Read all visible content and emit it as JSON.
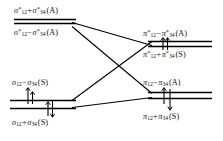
{
  "diagram": {
    "type": "molecular-orbital-correlation-diagram",
    "background_color": "#ffffff",
    "line_color": "#000000",
    "text_color": "#111111",
    "levels": {
      "sigma_star_antisym_plus": {
        "id": "sigma-star-plus",
        "label_text": "σ*12 + σ*34 (A)",
        "symbol": "σ",
        "star": "*",
        "sub_left": "12",
        "operator": "+",
        "sub_right": "34",
        "symmetry": "(A)",
        "side": "left",
        "position": "top"
      },
      "sigma_star_antisym_minus": {
        "id": "sigma-star-minus",
        "label_text": "σ*12 − σ*34 (A)",
        "symbol": "σ",
        "star": "*",
        "sub_left": "12",
        "operator": "−",
        "sub_right": "34",
        "symmetry": "(A)",
        "side": "left",
        "position": "upper-middle"
      },
      "pi_star_antisym_minus": {
        "id": "pi-star-minus",
        "label_text": "π*12 − π*34 (A)",
        "symbol": "π",
        "star": "*",
        "sub_left": "12",
        "operator": "−",
        "sub_right": "34",
        "symmetry": "(A)",
        "side": "right",
        "position": "top"
      },
      "pi_star_sym_plus": {
        "id": "pi-star-plus",
        "label_text": "π*12 + π*34 (S)",
        "symbol": "π",
        "star": "*",
        "sub_left": "12",
        "operator": "+",
        "sub_right": "34",
        "symmetry": "(S)",
        "side": "right",
        "position": "upper-middle"
      },
      "sigma_sym_minus": {
        "id": "sigma-minus",
        "label_text": "σ12 − σ34 (S)",
        "symbol": "σ",
        "star": "",
        "sub_left": "12",
        "operator": "−",
        "sub_right": "34",
        "symmetry": "(S)",
        "side": "left",
        "position": "lower-middle"
      },
      "sigma_sym_plus": {
        "id": "sigma-plus",
        "label_text": "σ12 + σ34 (S)",
        "symbol": "σ",
        "star": "",
        "sub_left": "12",
        "operator": "+",
        "sub_right": "34",
        "symmetry": "(S)",
        "side": "left",
        "position": "bottom"
      },
      "pi_antisym_minus": {
        "id": "pi-minus",
        "label_text": "π12 − π34 (A)",
        "symbol": "π",
        "star": "",
        "sub_left": "12",
        "operator": "−",
        "sub_right": "34",
        "symmetry": "(A)",
        "side": "right",
        "position": "lower-middle"
      },
      "pi_sym_plus": {
        "id": "pi-plus",
        "label_text": "π12 + π34 (S)",
        "symbol": "π",
        "star": "",
        "sub_left": "12",
        "operator": "+",
        "sub_right": "34",
        "symmetry": "(S)",
        "side": "right",
        "position": "bottom"
      }
    },
    "electron_arrows": {
      "upper_right_pair": {
        "count": 2,
        "directions": [
          "up",
          "up"
        ]
      },
      "lower_left_upper_pair": {
        "count": 2,
        "directions": [
          "up",
          "up"
        ]
      },
      "lower_left_lower_pair": {
        "count": 2,
        "directions": [
          "up",
          "down"
        ]
      },
      "lower_right_pair": {
        "count": 2,
        "directions": [
          "up",
          "down"
        ]
      }
    },
    "correlation_lines": [
      {
        "from": "sigma-star-plus",
        "to": "pi-star-plus"
      },
      {
        "from": "sigma-star-minus",
        "to": "pi-minus"
      },
      {
        "from": "sigma-minus",
        "to": "pi-star-minus"
      },
      {
        "from": "sigma-plus",
        "to": "pi-plus"
      }
    ]
  }
}
